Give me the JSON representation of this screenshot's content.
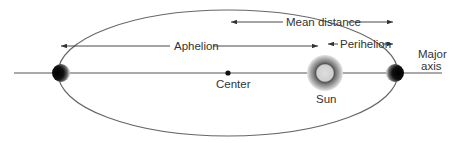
{
  "diagram": {
    "labels": {
      "mean_distance": "Mean distance",
      "aphelion": "Aphelion",
      "perihelion": "Perihelion",
      "center": "Center",
      "sun": "Sun",
      "major_axis_line1": "Major",
      "major_axis_line2": "axis"
    },
    "colors": {
      "line": "#555555",
      "planet": "#111111",
      "sun_core": "#cccccc",
      "sun_ring": "#666666",
      "sun_halo": "#bbbbbb"
    }
  }
}
